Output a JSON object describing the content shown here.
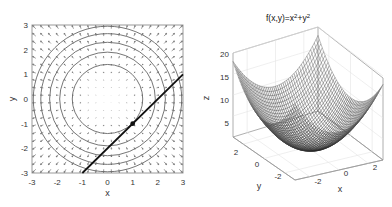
{
  "chart_data": [
    {
      "type": "scatter",
      "subtype": "contour-with-gradient-field",
      "title": "",
      "xlabel": "x",
      "ylabel": "y",
      "xlim": [
        -3,
        3
      ],
      "ylim": [
        -3,
        3
      ],
      "xticks": [
        "-3",
        "-2",
        "-1",
        "0",
        "1",
        "2",
        "3"
      ],
      "yticks": [
        "-3",
        "-2",
        "-1",
        "0",
        "1",
        "2",
        "3"
      ],
      "contour_radii": [
        1.4,
        1.9,
        2.3,
        2.65,
        2.95
      ],
      "gradient_field": "quiver of grad f = (2x, 2y), arrows pointing outward",
      "point": {
        "x": 1,
        "y": -1
      },
      "tangent_line": {
        "x": [
          -1,
          3
        ],
        "y": [
          -3,
          1
        ],
        "equation": "y = x - 2"
      },
      "grid": false
    },
    {
      "type": "surface",
      "subtype": "3d-mesh",
      "title": "f(x,y)=x²+y²",
      "xlabel": "x",
      "ylabel": "y",
      "zlabel": "z",
      "xticks": [
        "-2",
        "0",
        "2"
      ],
      "yticks": [
        "-2",
        "0",
        "2"
      ],
      "zticks": [
        "5",
        "10",
        "15",
        "20"
      ],
      "xlim": [
        -3,
        3
      ],
      "ylim": [
        -3,
        3
      ],
      "zlim": [
        0,
        20
      ],
      "function": "z = x^2 + y^2",
      "grid": true
    }
  ],
  "left": {
    "xlabel": "x",
    "ylabel": "y",
    "xticks": [
      "-3",
      "-2",
      "-1",
      "0",
      "1",
      "2",
      "3"
    ],
    "yticks": [
      "3",
      "2",
      "1",
      "0",
      "-1",
      "-2",
      "-3"
    ]
  },
  "right": {
    "title_base": "f(x,y)=x",
    "title_sup1": "2",
    "title_mid": "+y",
    "title_sup2": "2",
    "zlabel": "z",
    "xlabel": "x",
    "ylabel": "y",
    "zticks": [
      "20",
      "15",
      "10",
      "5"
    ],
    "xticks": [
      "-2",
      "0",
      "2"
    ],
    "yticks": [
      "2",
      "0",
      "-2"
    ]
  }
}
